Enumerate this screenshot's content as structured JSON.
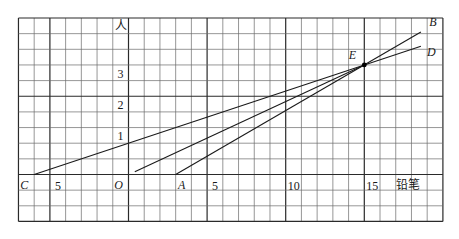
{
  "diagram": {
    "type": "coordinate-grid-line-graph",
    "x_axis_label": "铅笔",
    "y_axis_label": "人",
    "x_tick_labels": [
      {
        "value": -5,
        "text": "5"
      },
      {
        "value": 5,
        "text": "5"
      },
      {
        "value": 10,
        "text": "10"
      },
      {
        "value": 15,
        "text": "15"
      }
    ],
    "y_tick_labels": [
      {
        "value": 1,
        "text": "1"
      },
      {
        "value": 2,
        "text": "2"
      },
      {
        "value": 3,
        "text": "3"
      }
    ],
    "grid": {
      "x_range": [
        -7,
        20
      ],
      "y_range": [
        -1.5,
        5
      ],
      "x_step": 1,
      "y_step": 0.5,
      "major_every_cells": 5
    },
    "points": [
      {
        "name": "C",
        "x": -6,
        "y": 0
      },
      {
        "name": "O",
        "x": 0,
        "y": 0
      },
      {
        "name": "A",
        "x": 3,
        "y": 0
      },
      {
        "name": "E",
        "x": 15,
        "y": 3.5
      },
      {
        "name": "B",
        "x": 18.6,
        "y": 4.55
      },
      {
        "name": "D",
        "x": 18.6,
        "y": 4.1
      }
    ],
    "segments": [
      {
        "name": "line-CD",
        "from": [
          -6,
          0
        ],
        "to": [
          18.6,
          4.1
        ]
      },
      {
        "name": "line-OE",
        "from": [
          0.4,
          0.09
        ],
        "to": [
          15,
          3.5
        ]
      },
      {
        "name": "line-AB",
        "from": [
          3,
          0
        ],
        "to": [
          18.6,
          4.55
        ]
      }
    ],
    "colors": {
      "grid": "#6a6a6a",
      "grid_major": "#2a2a2a",
      "line": "#1a1a1a",
      "point": "#000000"
    }
  }
}
